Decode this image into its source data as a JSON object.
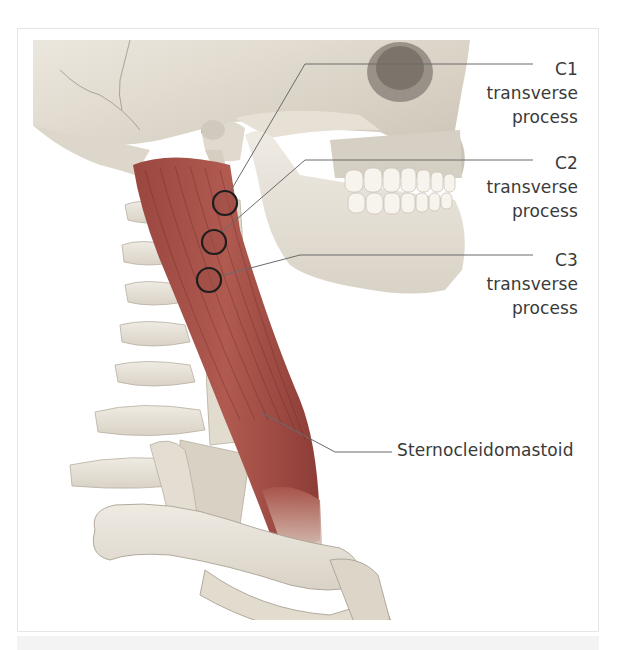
{
  "figure": {
    "colors": {
      "muscle": "#a9544a",
      "muscle_dark": "#7e3530",
      "bone": "#ebe6dc",
      "bone_shade": "#cfc8bb",
      "leader_line": "#6a6a6a",
      "marker_outline": "#1e1e1e",
      "label_text": "#3a3a3a"
    },
    "labels": [
      {
        "id": "c1",
        "lines": [
          "C1",
          "transverse",
          "process"
        ]
      },
      {
        "id": "c2",
        "lines": [
          "C2",
          "transverse",
          "process"
        ]
      },
      {
        "id": "c3",
        "lines": [
          "C3",
          "transverse",
          "process"
        ]
      },
      {
        "id": "scm",
        "lines": [
          "Sternocleidomastoid"
        ]
      }
    ],
    "markers": [
      {
        "name": "c1-marker",
        "cx": 225,
        "cy": 203,
        "r": 12
      },
      {
        "name": "c2-marker",
        "cx": 214,
        "cy": 242,
        "r": 12
      },
      {
        "name": "c3-marker",
        "cx": 209,
        "cy": 280,
        "r": 12
      }
    ]
  }
}
